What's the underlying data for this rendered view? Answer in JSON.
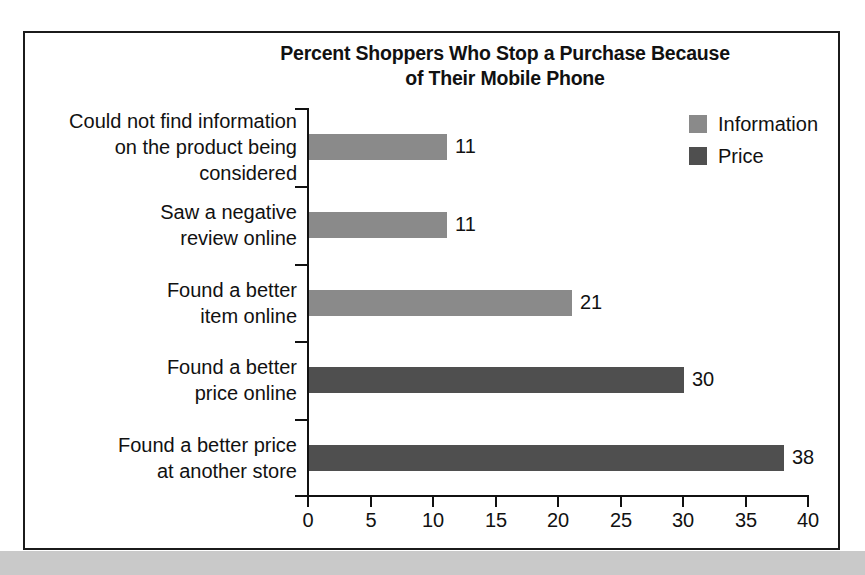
{
  "chart_data": {
    "type": "bar",
    "orientation": "horizontal",
    "title": "Percent Shoppers Who Stop a Purchase Because of Their Mobile Phone",
    "title_line1": "Percent Shoppers Who Stop a Purchase Because",
    "title_line2": "of Their Mobile Phone",
    "categories": [
      "Could not find information\non the product being\nconsidered",
      "Saw a negative\nreview online",
      "Found a better\nitem online",
      "Found a better\nprice online",
      "Found a better price\nat another store"
    ],
    "values": [
      11,
      11,
      21,
      30,
      38
    ],
    "series_of_point": [
      "Information",
      "Information",
      "Information",
      "Price",
      "Price"
    ],
    "series": [
      {
        "name": "Information",
        "color": "#8a8a8a",
        "values": [
          11,
          11,
          21,
          null,
          null
        ]
      },
      {
        "name": "Price",
        "color": "#4f4f4f",
        "values": [
          null,
          null,
          null,
          30,
          38
        ]
      }
    ],
    "legend": [
      {
        "label": "Information",
        "color": "#8a8a8a"
      },
      {
        "label": "Price",
        "color": "#4f4f4f"
      }
    ],
    "legend_position": "top-right",
    "xlabel": "",
    "ylabel": "",
    "xlim": [
      0,
      40
    ],
    "xticks": [
      0,
      5,
      10,
      15,
      20,
      25,
      30,
      35,
      40
    ],
    "xtick_labels": [
      "0",
      "5",
      "10",
      "15",
      "20",
      "25",
      "30",
      "35",
      "40"
    ],
    "grid": false,
    "data_labels": [
      "11",
      "11",
      "21",
      "30",
      "38"
    ]
  }
}
